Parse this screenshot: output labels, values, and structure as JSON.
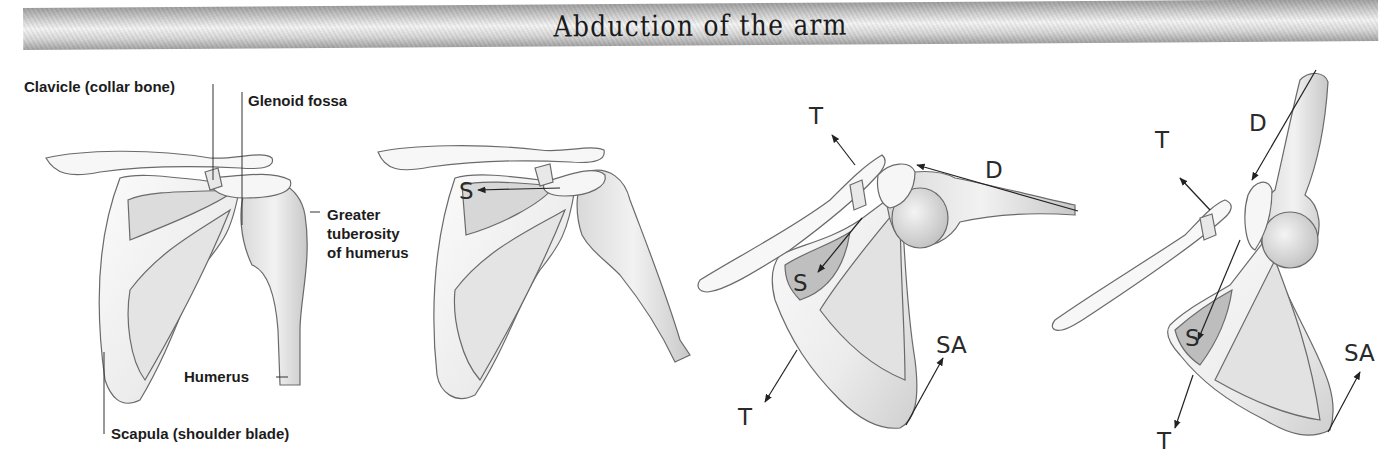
{
  "banner": {
    "title": "Abduction of the arm"
  },
  "panels": [
    {
      "id": "panel-1-resting",
      "labels": {
        "clavicle": "Clavicle (collar bone)",
        "glenoid": "Glenoid fossa",
        "greater_tuberosity_1": "Greater",
        "greater_tuberosity_2": "tuberosity",
        "greater_tuberosity_3": "of humerus",
        "humerus": "Humerus",
        "scapula": "Scapula (shoulder blade)"
      }
    },
    {
      "id": "panel-2-initiation",
      "force_labels": {
        "s": "S"
      }
    },
    {
      "id": "panel-3-mid-abduction",
      "force_labels": {
        "t_upper": "T",
        "d": "D",
        "s": "S",
        "sa": "SA",
        "t_lower": "T"
      }
    },
    {
      "id": "panel-4-full-abduction",
      "force_labels": {
        "t_upper": "T",
        "d": "D",
        "s": "S",
        "sa": "SA",
        "t_lower": "T"
      }
    }
  ],
  "colors": {
    "ink": "#1c1c1c",
    "bone_fill": "#f3f3f3",
    "bone_shade": "#c9c9c9",
    "outline": "#6a6a6a",
    "banner_dark": "#9e9e9e",
    "banner_light": "#f4f4f4"
  }
}
